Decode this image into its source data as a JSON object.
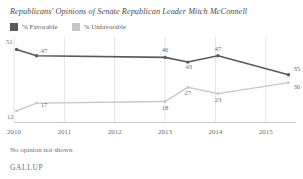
{
  "chart_data": {
    "type": "line",
    "title": "Republicans' Opinions of Senate Republican Leader Mitch McConnell",
    "xlabel": "",
    "ylabel": "",
    "grid": "vertical",
    "legend_position": "top-left",
    "xlim": [
      2010,
      2015.6
    ],
    "ylim": [
      5,
      57
    ],
    "x": [
      2010.05,
      2010.45,
      2013.0,
      2013.45,
      2014.05,
      2015.45
    ],
    "categories": [
      "2010",
      "2011",
      "2012",
      "2013",
      "2014",
      "2015"
    ],
    "tick_values": [
      2010,
      2011,
      2012,
      2013,
      2014,
      2015
    ],
    "series": [
      {
        "name": "% Favorable",
        "color": "#58595b",
        "values": [
          51,
          47,
          46,
          43,
          47,
          35
        ],
        "labels": [
          "51",
          "47",
          "46",
          "43",
          "47",
          "35"
        ]
      },
      {
        "name": "% Unfavorable",
        "color": "#c6c7c9",
        "values": [
          12,
          17,
          18,
          27,
          23,
          30
        ],
        "labels": [
          "12",
          "17",
          "18",
          "27",
          "23",
          "30"
        ]
      }
    ]
  },
  "legend": {
    "items": [
      {
        "label": "% Favorable",
        "color": "#58595b"
      },
      {
        "label": "% Unfavorable",
        "color": "#c6c7c9"
      }
    ]
  },
  "footer": {
    "note": "No opinion not shown",
    "brand": "GALLUP"
  }
}
